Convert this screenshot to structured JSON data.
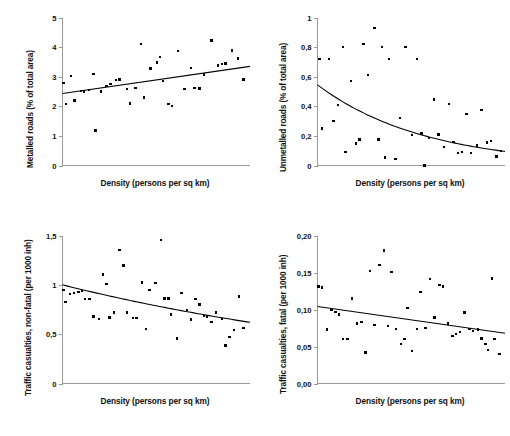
{
  "figure": {
    "name": "four-panel-scatter-figure",
    "panel_count": 4
  },
  "chart_data": [
    {
      "id": "metalled-roads",
      "type": "scatter",
      "title": "",
      "xlabel": "Density (persons per sq km)",
      "ylabel": "Metalled roads (% of total area)",
      "xticklabels": [],
      "yticklabels": [
        "0",
        "1",
        "2",
        "3",
        "4",
        "5"
      ],
      "ytickvalues": [
        0,
        1,
        2,
        3,
        4,
        5
      ],
      "ylim": [
        0,
        5
      ],
      "xlim": [
        0,
        100
      ],
      "grid": false,
      "legend": false,
      "trend": {
        "kind": "linear",
        "description": "increasing straight fit line",
        "x_start": 0,
        "y_start": 2.43,
        "x_end": 100,
        "y_end": 3.35
      },
      "points": [
        [
          0.5,
          2.78
        ],
        [
          2.0,
          2.08
        ],
        [
          4.5,
          3.02
        ],
        [
          6.5,
          2.2
        ],
        [
          10.0,
          2.52
        ],
        [
          11.5,
          2.5
        ],
        [
          14.0,
          2.55
        ],
        [
          16.5,
          3.1
        ],
        [
          17.5,
          1.18
        ],
        [
          20.5,
          2.5
        ],
        [
          23.5,
          2.68
        ],
        [
          25.5,
          2.75
        ],
        [
          28.5,
          2.88
        ],
        [
          30.5,
          2.9
        ],
        [
          34.5,
          2.58
        ],
        [
          36.0,
          2.1
        ],
        [
          39.0,
          2.62
        ],
        [
          42.0,
          4.1
        ],
        [
          43.5,
          2.3
        ],
        [
          47.0,
          3.28
        ],
        [
          50.5,
          3.48
        ],
        [
          52.0,
          3.66
        ],
        [
          53.5,
          2.86
        ],
        [
          56.5,
          2.08
        ],
        [
          58.5,
          2.02
        ],
        [
          61.5,
          3.86
        ],
        [
          65.0,
          2.58
        ],
        [
          68.5,
          3.3
        ],
        [
          70.5,
          2.62
        ],
        [
          73.0,
          2.6
        ],
        [
          75.5,
          3.08
        ],
        [
          79.5,
          4.22
        ],
        [
          83.0,
          3.38
        ],
        [
          85.0,
          3.42
        ],
        [
          87.0,
          3.44
        ],
        [
          90.5,
          3.88
        ],
        [
          93.5,
          3.62
        ],
        [
          96.5,
          2.9
        ]
      ]
    },
    {
      "id": "unmetalled-roads",
      "type": "scatter",
      "title": "",
      "xlabel": "Density (persons per sq km)",
      "ylabel": "Unmetalled roads (% of total area)",
      "xticklabels": [],
      "yticklabels": [
        "0",
        "0,2",
        "0,4",
        "0,6",
        "0,8",
        "1"
      ],
      "ytickvalues": [
        0,
        0.2,
        0.4,
        0.6,
        0.8,
        1
      ],
      "ylim": [
        0,
        1
      ],
      "xlim": [
        0,
        100
      ],
      "grid": false,
      "legend": false,
      "trend": {
        "kind": "exponential-decay",
        "description": "decreasing curved fit line",
        "x_start": 0,
        "y_start": 0.545,
        "x_end": 100,
        "y_end": 0.095
      },
      "points": [
        [
          1.0,
          0.72
        ],
        [
          2.5,
          0.25
        ],
        [
          6.0,
          0.72
        ],
        [
          8.5,
          0.3
        ],
        [
          11.0,
          0.41
        ],
        [
          13.5,
          0.8
        ],
        [
          15.0,
          0.09
        ],
        [
          18.0,
          0.57
        ],
        [
          20.5,
          0.15
        ],
        [
          22.5,
          0.175
        ],
        [
          24.5,
          0.82
        ],
        [
          27.0,
          0.61
        ],
        [
          30.5,
          0.93
        ],
        [
          32.5,
          0.175
        ],
        [
          34.5,
          0.8
        ],
        [
          36.0,
          0.055
        ],
        [
          38.0,
          0.72
        ],
        [
          41.5,
          0.045
        ],
        [
          44.0,
          0.32
        ],
        [
          47.0,
          0.8
        ],
        [
          50.5,
          0.205
        ],
        [
          53.0,
          0.72
        ],
        [
          55.5,
          0.215
        ],
        [
          57.0,
          0.0
        ],
        [
          59.5,
          0.185
        ],
        [
          62.0,
          0.445
        ],
        [
          64.5,
          0.21
        ],
        [
          67.5,
          0.125
        ],
        [
          70.0,
          0.415
        ],
        [
          72.5,
          0.16
        ],
        [
          75.0,
          0.085
        ],
        [
          77.0,
          0.09
        ],
        [
          79.5,
          0.35
        ],
        [
          82.0,
          0.085
        ],
        [
          85.0,
          0.135
        ],
        [
          87.5,
          0.375
        ],
        [
          90.5,
          0.155
        ],
        [
          92.5,
          0.165
        ],
        [
          95.5,
          0.06
        ],
        [
          98.0,
          0.1
        ]
      ]
    },
    {
      "id": "traffic-casualties-non-fatal",
      "type": "scatter",
      "title": "",
      "xlabel": "Density (persons per sq km)",
      "ylabel": "Traffic casualties, non-fatal (per 1000 inh)",
      "xticklabels": [],
      "yticklabels": [
        "0",
        "0,5",
        "1",
        "1,5"
      ],
      "ytickvalues": [
        0,
        0.5,
        1,
        1.5
      ],
      "ylim": [
        0,
        1.5
      ],
      "xlim": [
        0,
        100
      ],
      "grid": false,
      "legend": false,
      "trend": {
        "kind": "gentle-decay",
        "description": "slightly decreasing curved fit line",
        "x_start": 0,
        "y_start": 1.0,
        "x_end": 100,
        "y_end": 0.62
      },
      "points": [
        [
          0.5,
          0.945
        ],
        [
          1.5,
          0.825
        ],
        [
          4.0,
          0.91
        ],
        [
          6.0,
          0.915
        ],
        [
          8.5,
          0.925
        ],
        [
          10.5,
          0.94
        ],
        [
          12.0,
          0.855
        ],
        [
          14.5,
          0.855
        ],
        [
          16.5,
          0.68
        ],
        [
          19.5,
          0.655
        ],
        [
          21.5,
          1.105
        ],
        [
          23.5,
          1.01
        ],
        [
          25.0,
          0.67
        ],
        [
          27.5,
          0.72
        ],
        [
          30.5,
          1.355
        ],
        [
          32.5,
          1.195
        ],
        [
          34.5,
          0.72
        ],
        [
          37.5,
          0.665
        ],
        [
          39.5,
          0.665
        ],
        [
          42.5,
          1.025
        ],
        [
          44.5,
          0.555
        ],
        [
          46.5,
          0.945
        ],
        [
          49.5,
          1.02
        ],
        [
          52.5,
          1.455
        ],
        [
          54.5,
          0.86
        ],
        [
          56.5,
          0.86
        ],
        [
          58.0,
          0.7
        ],
        [
          61.0,
          0.455
        ],
        [
          63.5,
          0.915
        ],
        [
          66.5,
          0.745
        ],
        [
          68.5,
          0.65
        ],
        [
          71.0,
          0.855
        ],
        [
          73.0,
          0.8
        ],
        [
          75.5,
          0.685
        ],
        [
          77.0,
          0.68
        ],
        [
          79.5,
          0.625
        ],
        [
          82.0,
          0.72
        ],
        [
          85.0,
          0.655
        ],
        [
          87.0,
          0.385
        ],
        [
          89.0,
          0.47
        ],
        [
          91.5,
          0.545
        ],
        [
          94.0,
          0.88
        ],
        [
          96.5,
          0.565
        ]
      ]
    },
    {
      "id": "traffic-casualties-fatal",
      "type": "scatter",
      "title": "",
      "xlabel": "Density (persons per sq km)",
      "ylabel": "Traffic casualties, fatal (per 1000 inh)",
      "xticklabels": [],
      "yticklabels": [
        "0,00",
        "0,05",
        "0,10",
        "0,15",
        "0,20"
      ],
      "ytickvalues": [
        0,
        0.05,
        0.1,
        0.15,
        0.2
      ],
      "ylim": [
        0,
        0.2
      ],
      "xlim": [
        0,
        100
      ],
      "grid": false,
      "legend": false,
      "trend": {
        "kind": "linear",
        "description": "slightly decreasing straight fit line",
        "x_start": 0,
        "y_start": 0.104,
        "x_end": 100,
        "y_end": 0.068
      },
      "points": [
        [
          0.5,
          0.131
        ],
        [
          2.5,
          0.13
        ],
        [
          5.0,
          0.073
        ],
        [
          7.5,
          0.099
        ],
        [
          9.5,
          0.097
        ],
        [
          11.5,
          0.093
        ],
        [
          13.5,
          0.06
        ],
        [
          16.0,
          0.06
        ],
        [
          18.5,
          0.115
        ],
        [
          21.0,
          0.081
        ],
        [
          23.5,
          0.083
        ],
        [
          25.5,
          0.042
        ],
        [
          28.0,
          0.152
        ],
        [
          30.5,
          0.079
        ],
        [
          33.0,
          0.16
        ],
        [
          35.5,
          0.18
        ],
        [
          37.5,
          0.078
        ],
        [
          39.5,
          0.151
        ],
        [
          42.0,
          0.074
        ],
        [
          44.5,
          0.053
        ],
        [
          46.5,
          0.06
        ],
        [
          48.0,
          0.102
        ],
        [
          50.5,
          0.044
        ],
        [
          53.0,
          0.074
        ],
        [
          55.0,
          0.124
        ],
        [
          57.5,
          0.075
        ],
        [
          60.0,
          0.141
        ],
        [
          62.5,
          0.089
        ],
        [
          65.0,
          0.133
        ],
        [
          67.0,
          0.131
        ],
        [
          69.5,
          0.081
        ],
        [
          72.0,
          0.064
        ],
        [
          74.0,
          0.067
        ],
        [
          76.0,
          0.07
        ],
        [
          78.5,
          0.096
        ],
        [
          81.0,
          0.074
        ],
        [
          83.0,
          0.071
        ],
        [
          85.5,
          0.073
        ],
        [
          87.5,
          0.061
        ],
        [
          89.5,
          0.053
        ],
        [
          91.0,
          0.045
        ],
        [
          93.0,
          0.142
        ],
        [
          94.5,
          0.06
        ],
        [
          97.0,
          0.04
        ]
      ]
    }
  ]
}
